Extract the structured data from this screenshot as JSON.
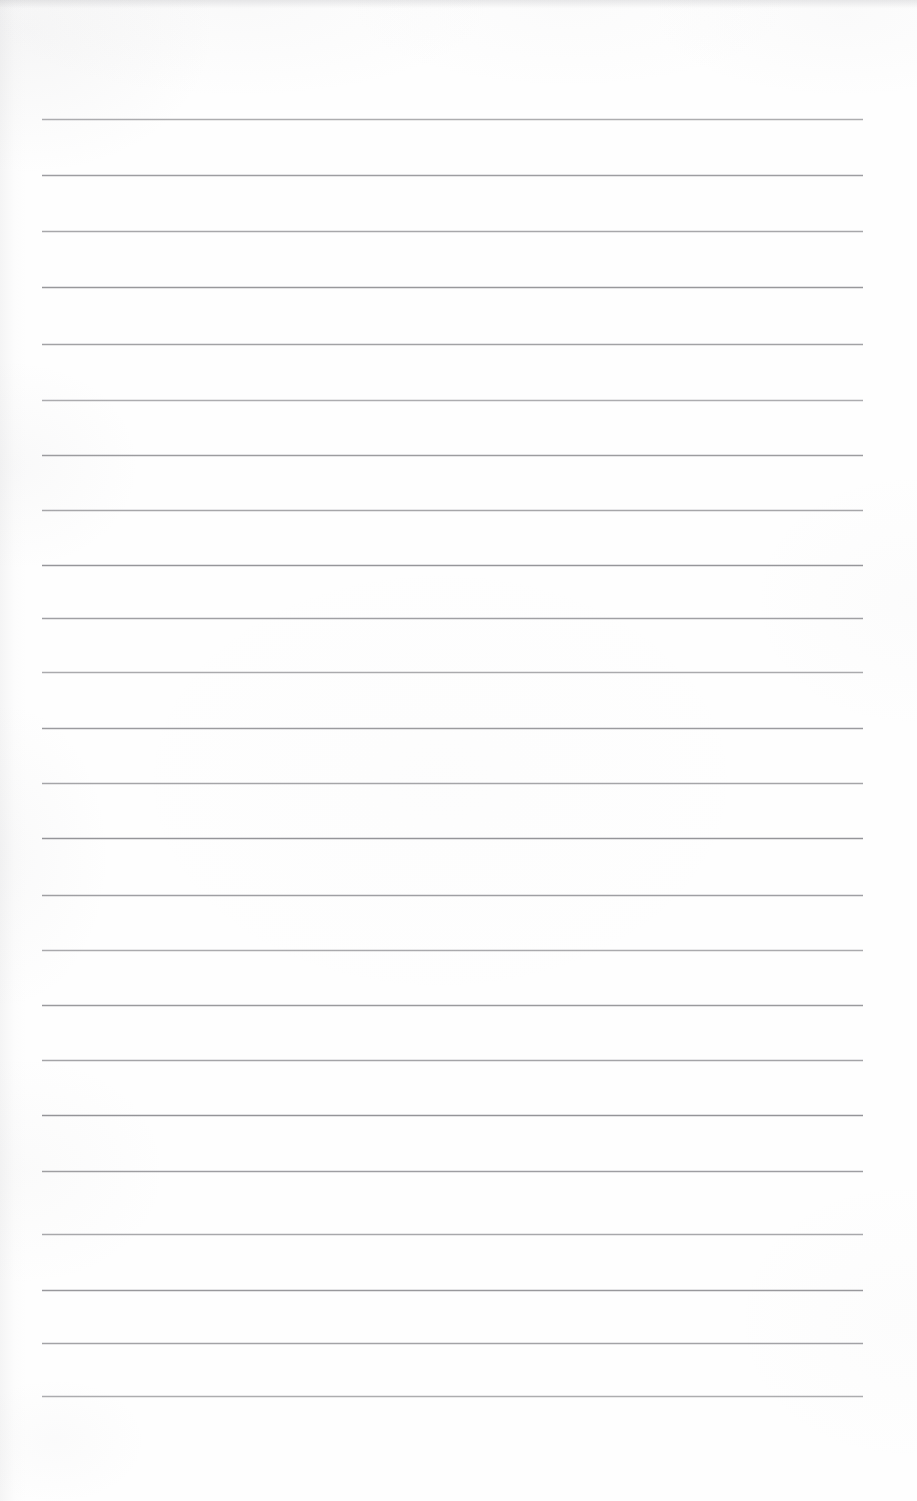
{
  "document": {
    "kind": "scanned-blank-ruled-paper",
    "title": "Blank Ruled Notebook Page",
    "visible_text": "",
    "handwriting": "",
    "printed_text": "",
    "page_number": "",
    "header_text": "",
    "footer_text": "",
    "margin_note": ""
  },
  "page": {
    "width": 917,
    "height": 1501,
    "background_color": "#fefefe",
    "paper_color": "#ffffff"
  },
  "ruling": {
    "style": "horizontal-ruled",
    "line_color": "#8e8e92",
    "line_thickness_px": 1,
    "line_count": 24,
    "line_left_x": 42,
    "line_right_x": 863,
    "line_length_px": 821,
    "first_line_y": 119,
    "line_spacing_px": 55.5,
    "has_vertical_margin_rule": false,
    "lines_y": [
      119,
      175,
      231,
      287,
      344,
      400,
      455,
      510,
      565,
      618,
      672,
      728,
      783,
      838,
      895,
      950,
      1005,
      1060,
      1115,
      1171,
      1234,
      1290,
      1343,
      1396
    ]
  },
  "scan_artifacts": {
    "top_edge_band_color": "#9e9ea3",
    "top_edge_band_height_px": 9,
    "left_edge_shading_width_px": 26,
    "mottling": "faint grey blotches near left and top edges"
  }
}
